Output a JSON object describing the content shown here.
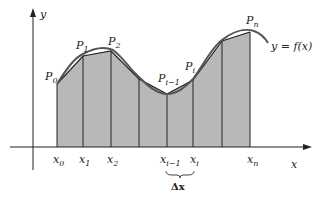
{
  "diagram": {
    "axes": {
      "x_label": "x",
      "y_label": "y",
      "x_tick_labels": [
        {
          "main": "x",
          "sub": "0",
          "x": 57
        },
        {
          "main": "x",
          "sub": "1",
          "x": 83
        },
        {
          "main": "x",
          "sub": "2",
          "x": 111
        },
        {
          "main": "x",
          "sub": "i−1",
          "x": 167
        },
        {
          "main": "x",
          "sub": "i",
          "x": 193
        },
        {
          "main": "x",
          "sub": "n",
          "x": 250
        }
      ]
    },
    "curve_label": "y = f(x)",
    "point_labels": [
      {
        "main": "P",
        "sub": "0"
      },
      {
        "main": "P",
        "sub": "1"
      },
      {
        "main": "P",
        "sub": "2"
      },
      {
        "main": "P",
        "sub": "i−1"
      },
      {
        "main": "P",
        "sub": "i"
      },
      {
        "main": "P",
        "sub": "n"
      }
    ],
    "interval_label": "Δx",
    "colors": {
      "fill": "#b5b5b5",
      "line": "#222222",
      "curve": "#444444",
      "background": "#ffffff"
    }
  }
}
